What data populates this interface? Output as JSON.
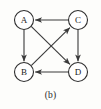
{
  "figure": {
    "caption": "(b)",
    "background_color": "#fdfdfb",
    "stroke_color": "#3a3a3a",
    "node_fill_color": "#ffffff",
    "node_label_color": "#1a1a1a"
  },
  "graph": {
    "type": "directed-graph",
    "node_radius": 9.5,
    "nodes": [
      {
        "id": "A",
        "label": "A",
        "cx": 24,
        "cy": 20
      },
      {
        "id": "B",
        "label": "B",
        "cx": 24,
        "cy": 72
      },
      {
        "id": "C",
        "label": "C",
        "cx": 78,
        "cy": 20
      },
      {
        "id": "D",
        "label": "D",
        "cx": 78,
        "cy": 72
      }
    ],
    "edges": [
      {
        "id": "C-A",
        "from": "C",
        "to": "A",
        "kind": "top-horizontal",
        "direction": "leftward"
      },
      {
        "id": "A-B",
        "from": "A",
        "to": "B",
        "kind": "left-vertical",
        "direction": "downward"
      },
      {
        "id": "C-D",
        "from": "C",
        "to": "D",
        "kind": "right-vertical",
        "direction": "downward"
      },
      {
        "id": "D-B",
        "from": "D",
        "to": "B",
        "kind": "bottom-horizontal",
        "direction": "leftward"
      },
      {
        "id": "A-D",
        "from": "A",
        "to": "D",
        "kind": "diagonal",
        "direction": "down-right"
      },
      {
        "id": "B-C",
        "from": "B",
        "to": "C",
        "kind": "diagonal",
        "direction": "up-right"
      }
    ]
  }
}
